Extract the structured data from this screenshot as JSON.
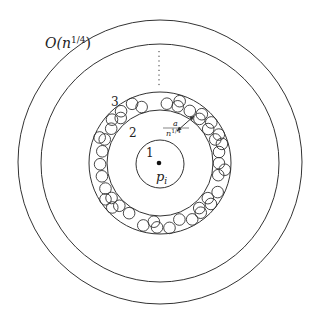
{
  "diagram": {
    "center": {
      "x": 160,
      "y": 163
    },
    "stroke_color": "#333333",
    "circles": {
      "outer_radius": 142,
      "second_radius": 119,
      "annulus_outer_radius": 71,
      "annulus_inner_radius": 53,
      "inner_radius": 24,
      "small_circle_radius": 5.8
    },
    "labels": {
      "outer": "O(n",
      "outer_exp": "1/4",
      "outer_close": ")",
      "region1": "1",
      "region2": "2",
      "region3": "3",
      "point": "p",
      "point_sub": "i",
      "width_num": "a",
      "width_den": "n",
      "width_den_exp": "1/4"
    }
  }
}
